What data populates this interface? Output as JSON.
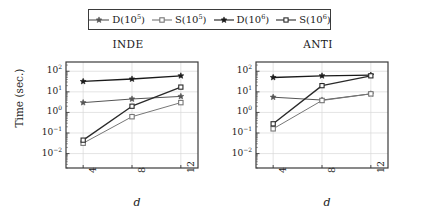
{
  "figure": {
    "width": 421,
    "height": 220,
    "background": "#ffffff",
    "axis_color": "#3b3b3b",
    "grid_color": "#d9d9d9"
  },
  "legend": {
    "position": "top-center",
    "entries": [
      {
        "label_main": "D(10",
        "label_sup": "5",
        "label_tail": ")",
        "marker": "star-open",
        "color": "#555555",
        "name": "legend-item-d5"
      },
      {
        "label_main": "S(10",
        "label_sup": "5",
        "label_tail": ")",
        "marker": "square-open",
        "color": "#777777",
        "name": "legend-item-s5"
      },
      {
        "label_main": "D(10",
        "label_sup": "6",
        "label_tail": ")",
        "marker": "star-filled",
        "color": "#1a1a1a",
        "name": "legend-item-d6"
      },
      {
        "label_main": "S(10",
        "label_sup": "6",
        "label_tail": ")",
        "marker": "square-filled",
        "color": "#2a2a2a",
        "name": "legend-item-s6"
      }
    ]
  },
  "axes": {
    "ylabel": "Time (sec.)",
    "xlabel": "d",
    "yticks": [
      {
        "mant": "10",
        "exp": "2"
      },
      {
        "mant": "10",
        "exp": "1"
      },
      {
        "mant": "10",
        "exp": "0"
      },
      {
        "mant": "10",
        "exp": "−1"
      },
      {
        "mant": "10",
        "exp": "−2"
      }
    ],
    "xticks": [
      "4",
      "8",
      "12"
    ],
    "ylim": [
      -2.7,
      2.45
    ],
    "yscale": "log",
    "grid": true
  },
  "chart_data": [
    {
      "type": "line",
      "title": "INDE",
      "xlabel": "d",
      "ylabel": "Time (sec.)",
      "yscale": "log",
      "ylim": [
        0.002,
        280
      ],
      "x": [
        4,
        8,
        12
      ],
      "categories": [
        "4",
        "8",
        "12"
      ],
      "grid": true,
      "legend_position": "top",
      "series": [
        {
          "name": "D(10^5)",
          "marker": "star-open",
          "color": "#555555",
          "values": [
            3.0,
            4.5,
            6.0
          ]
        },
        {
          "name": "S(10^5)",
          "marker": "square-open",
          "color": "#777777",
          "values": [
            0.032,
            0.62,
            3.0
          ]
        },
        {
          "name": "D(10^6)",
          "marker": "star-filled",
          "color": "#1a1a1a",
          "values": [
            32.0,
            42.0,
            60.0
          ]
        },
        {
          "name": "S(10^6)",
          "marker": "square-filled",
          "color": "#2a2a2a",
          "values": [
            0.045,
            2.0,
            17.0
          ]
        }
      ]
    },
    {
      "type": "line",
      "title": "ANTI",
      "xlabel": "d",
      "ylabel": "Time (sec.)",
      "yscale": "log",
      "ylim": [
        0.002,
        280
      ],
      "x": [
        4,
        8,
        12
      ],
      "categories": [
        "4",
        "8",
        "12"
      ],
      "grid": true,
      "legend_position": "top",
      "series": [
        {
          "name": "D(10^5)",
          "marker": "star-open",
          "color": "#555555",
          "values": [
            5.5,
            4.0,
            8.0
          ]
        },
        {
          "name": "S(10^5)",
          "marker": "square-open",
          "color": "#777777",
          "values": [
            0.16,
            3.8,
            8.0
          ]
        },
        {
          "name": "D(10^6)",
          "marker": "star-filled",
          "color": "#1a1a1a",
          "values": [
            50.0,
            60.0,
            65.0
          ]
        },
        {
          "name": "S(10^6)",
          "marker": "square-filled",
          "color": "#2a2a2a",
          "values": [
            0.28,
            20.0,
            60.0
          ]
        }
      ]
    }
  ]
}
